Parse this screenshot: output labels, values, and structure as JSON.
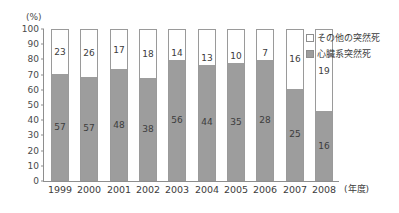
{
  "chart_data": {
    "type": "bar",
    "subtype": "stacked-bar-100",
    "title": "",
    "xlabel": "(年度)",
    "ylabel": "(%)",
    "ylim": [
      0,
      100
    ],
    "ytick_step": 10,
    "yticks": [
      100,
      90,
      80,
      70,
      60,
      50,
      40,
      30,
      20,
      10,
      0
    ],
    "grid": false,
    "legend_position": "right-top",
    "categories": [
      "1999",
      "2000",
      "2001",
      "2002",
      "2003",
      "2004",
      "2005",
      "2006",
      "2007",
      "2008"
    ],
    "series": [
      {
        "name": "心臓系突然死",
        "color": "#9d9d9d",
        "values": [
          57,
          57,
          48,
          38,
          56,
          44,
          35,
          28,
          25,
          16
        ],
        "percent_of_bar": [
          71,
          69,
          74,
          68,
          80,
          77,
          78,
          80,
          61,
          46
        ]
      },
      {
        "name": "その他の突然死",
        "color": "#ffffff",
        "values": [
          23,
          26,
          17,
          18,
          14,
          13,
          10,
          7,
          16,
          19
        ],
        "percent_of_bar": [
          29,
          31,
          26,
          32,
          20,
          23,
          22,
          20,
          39,
          54
        ]
      }
    ],
    "legend": [
      "その他の突然死",
      "心臓系突然死"
    ]
  },
  "axes": {
    "y_unit": "(%)",
    "x_unit": "(年度)"
  }
}
